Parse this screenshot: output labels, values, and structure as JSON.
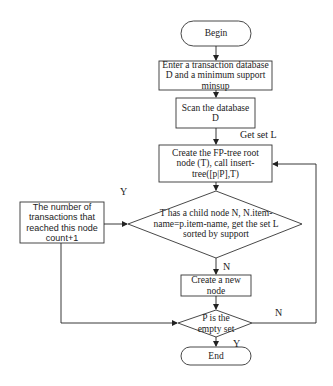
{
  "diagram": {
    "type": "flowchart",
    "stroke_color": "#333333",
    "background": "#ffffff",
    "nodes": {
      "begin": {
        "shape": "terminator",
        "text": "Begin"
      },
      "enter": {
        "shape": "process",
        "text": "Enter a transaction database D and a minimum support minsup"
      },
      "scan": {
        "shape": "process",
        "text": "Scan the database D"
      },
      "create_tree": {
        "shape": "process",
        "text": "Create the FP-tree root node (T), call insert-tree([p|P],T)"
      },
      "has_child": {
        "shape": "decision",
        "text": "T has a child node N, N.item-name=p.item-name, get the set L sorted by support"
      },
      "count_inc": {
        "shape": "process",
        "text": "The number of transactions that reached this node count+1"
      },
      "create_node": {
        "shape": "process",
        "text": "Create a new node"
      },
      "empty_set": {
        "shape": "decision",
        "text": "P is the empty set"
      },
      "end": {
        "shape": "terminator",
        "text": "End"
      }
    },
    "edge_labels": {
      "get_set_l": "Get set L",
      "yes_to_count": "Y",
      "no_to_create": "N",
      "no_loop_back": "N",
      "yes_to_end": "Y"
    },
    "edges": [
      {
        "from": "begin",
        "to": "enter",
        "label": ""
      },
      {
        "from": "enter",
        "to": "scan",
        "label": ""
      },
      {
        "from": "scan",
        "to": "create_tree",
        "label": "Get set L"
      },
      {
        "from": "create_tree",
        "to": "has_child",
        "label": ""
      },
      {
        "from": "has_child",
        "to": "count_inc",
        "label": "Y"
      },
      {
        "from": "has_child",
        "to": "create_node",
        "label": "N"
      },
      {
        "from": "count_inc",
        "to": "empty_set",
        "label": ""
      },
      {
        "from": "create_node",
        "to": "empty_set",
        "label": ""
      },
      {
        "from": "empty_set",
        "to": "create_tree",
        "label": "N"
      },
      {
        "from": "empty_set",
        "to": "end",
        "label": "Y"
      }
    ]
  }
}
